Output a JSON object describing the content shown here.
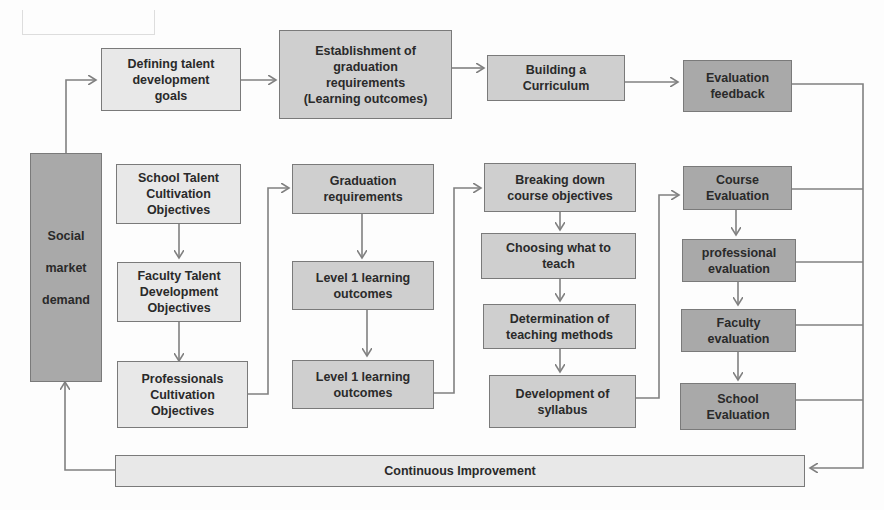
{
  "diagram": {
    "colors": {
      "light": "#e8e8e8",
      "mid": "#cfcfcf",
      "dark": "#a9a9a9",
      "border": "#7a7a7a",
      "line": "#808080",
      "text": "#2a2a2a"
    },
    "top_row": [
      {
        "id": "goals",
        "label": "Defining talent\ndevelopment\ngoals"
      },
      {
        "id": "grad-req",
        "label": "Establishment of\ngraduation\nrequirements\n(Learning outcomes)"
      },
      {
        "id": "curriculum",
        "label": "Building a\nCurriculum"
      },
      {
        "id": "eval-feedback",
        "label": "Evaluation\nfeedback"
      }
    ],
    "social": {
      "label": "Social\n\nmarket\n\ndemand"
    },
    "col1": [
      {
        "label": "School Talent\nCultivation\nObjectives"
      },
      {
        "label": "Faculty Talent\nDevelopment\nObjectives"
      },
      {
        "label": "Professionals\nCultivation\nObjectives"
      }
    ],
    "col2": [
      {
        "label": "Graduation\nrequirements"
      },
      {
        "label": "Level 1 learning\noutcomes"
      },
      {
        "label": "Level 1 learning\noutcomes"
      }
    ],
    "col3": [
      {
        "label": "Breaking down\ncourse objectives"
      },
      {
        "label": "Choosing what to\nteach"
      },
      {
        "label": "Determination of\nteaching methods"
      },
      {
        "label": "Development of\nsyllabus"
      }
    ],
    "col4": [
      {
        "label": "Course\nEvaluation"
      },
      {
        "label": "professional\nevaluation"
      },
      {
        "label": "Faculty\nevaluation"
      },
      {
        "label": "School\nEvaluation"
      }
    ],
    "bottom": {
      "label": "Continuous Improvement"
    }
  }
}
